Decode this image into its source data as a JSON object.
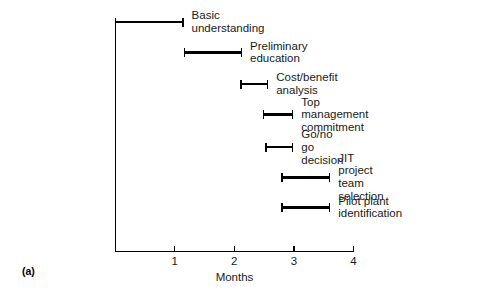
{
  "caption": "(a)",
  "chart_data": {
    "type": "bar",
    "title": "",
    "xlabel": "Months",
    "ylabel": "",
    "xlim": [
      0,
      4
    ],
    "tick_labels": [
      "1",
      "2",
      "3",
      "4"
    ],
    "tick_values": [
      1,
      2,
      3,
      4
    ],
    "grid": false,
    "legend": "none",
    "orientation": "horizontal",
    "style": "gantt",
    "categories": [
      "Basic understanding",
      "Preliminary education",
      "Cost/benefit analysis",
      "Top management commitment",
      "Go/no go decision",
      "JIT project team selection",
      "Pilot plant identification"
    ],
    "tasks": [
      {
        "label": "Basic understanding",
        "start": 0.0,
        "end": 1.15,
        "duration": 1.15
      },
      {
        "label": "Preliminary education",
        "start": 1.15,
        "end": 2.13,
        "duration": 0.98
      },
      {
        "label": "Cost/benefit analysis",
        "start": 2.1,
        "end": 2.57,
        "duration": 0.47
      },
      {
        "label": "Top management commitment",
        "start": 2.48,
        "end": 2.99,
        "duration": 0.51
      },
      {
        "label": "Go/no go decision",
        "start": 2.52,
        "end": 2.99,
        "duration": 0.47
      },
      {
        "label": "JIT project team\nselection",
        "start": 2.79,
        "end": 3.61,
        "duration": 0.82
      },
      {
        "label": "Pilot plant\nidentification",
        "start": 2.79,
        "end": 3.61,
        "duration": 0.82
      }
    ],
    "colors": {
      "bar": "#000000",
      "axis": "#000000",
      "background": "#ffffff"
    }
  }
}
